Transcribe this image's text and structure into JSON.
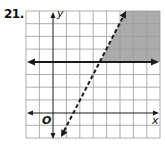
{
  "problem": {
    "number": "21."
  },
  "graph": {
    "x_axis_label": "x",
    "y_axis_label": "y",
    "origin_label": "O",
    "grid": {
      "x_min": -2,
      "x_max": 8,
      "y_min": -2,
      "y_max": 8,
      "columns": 10,
      "rows": 10
    },
    "boundaries": [
      {
        "equation": "y = 4",
        "style": "solid",
        "inclusive": true
      },
      {
        "equation": "y = 2x - 3",
        "style": "dashed",
        "inclusive": false
      }
    ],
    "shaded_region": "y >= 4 and y < 2x - 3",
    "colors": {
      "shade": "#a9a9a9",
      "grid": "#9a9a9a",
      "line": "#1a1a1a"
    }
  }
}
